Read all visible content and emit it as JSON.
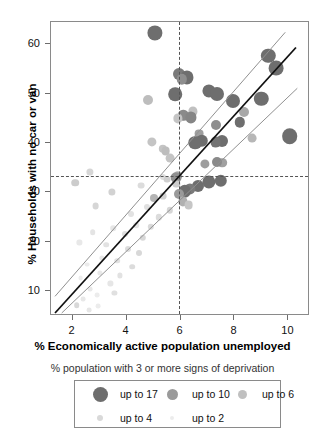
{
  "chart_data": {
    "type": "scatter",
    "title": "",
    "xlabel": "% Economically active population unemployed",
    "ylabel": "% Households with no car or van",
    "xlim": [
      1.2,
      10.8
    ],
    "ylim": [
      5.0,
      64.5
    ],
    "xticks": [
      2,
      4,
      6,
      8,
      10
    ],
    "yticks": [
      10,
      20,
      30,
      40,
      50,
      60
    ],
    "xticklabels": [
      "2",
      "4",
      "6",
      "8",
      "10"
    ],
    "yticklabels": [
      "10",
      "20",
      "30",
      "40",
      "50",
      "60"
    ],
    "grid": false,
    "legend_position": "below-axes",
    "legend_title": "% population with 3 or more signs of deprivation",
    "legend_entries": [
      {
        "label": "up to 17",
        "color": "#6e6e6e",
        "radius": 7.5
      },
      {
        "label": "up to 10",
        "color": "#9a9a9a",
        "radius": 5.5
      },
      {
        "label": "up to 6",
        "color": "#c0c0c0",
        "radius": 4.5
      },
      {
        "label": "up to 4",
        "color": "#d9d9d9",
        "radius": 3.2
      },
      {
        "label": "up to 2",
        "color": "#ececec",
        "radius": 2.4
      }
    ],
    "reference_lines": [
      {
        "orientation": "vertical",
        "value": 5.95,
        "style": "dotted",
        "color": "#555555"
      },
      {
        "orientation": "horizontal",
        "value": 33.4,
        "style": "dotted",
        "color": "#555555"
      }
    ],
    "fit_lines": [
      {
        "name": "regression",
        "color": "#111111",
        "width": 1.8,
        "x0": 1.35,
        "y0": 5.2,
        "x1": 10.35,
        "y1": 59.3
      },
      {
        "name": "upper-band",
        "color": "#8f8f8f",
        "width": 1.0,
        "x0": 1.35,
        "y0": 8.6,
        "x1": 9.95,
        "y1": 62.4
      },
      {
        "name": "lower-band",
        "color": "#8f8f8f",
        "width": 1.0,
        "x0": 1.6,
        "y0": 5.2,
        "x1": 10.4,
        "y1": 51.0
      }
    ],
    "points": [
      {
        "x": 5.05,
        "y": 62.3,
        "c": "#6e6e6e",
        "r": 7.6
      },
      {
        "x": 9.25,
        "y": 57.6,
        "c": "#6e6e6e",
        "r": 7.2
      },
      {
        "x": 9.55,
        "y": 55.2,
        "c": "#6e6e6e",
        "r": 7.4
      },
      {
        "x": 5.95,
        "y": 53.9,
        "c": "#7a7a7a",
        "r": 6.0
      },
      {
        "x": 6.25,
        "y": 53.3,
        "c": "#6e6e6e",
        "r": 6.6
      },
      {
        "x": 6.05,
        "y": 52.9,
        "c": "#8e8e8e",
        "r": 5.2
      },
      {
        "x": 5.8,
        "y": 49.9,
        "c": "#6e6e6e",
        "r": 6.8
      },
      {
        "x": 7.05,
        "y": 50.6,
        "c": "#6e6e6e",
        "r": 6.6
      },
      {
        "x": 7.35,
        "y": 49.9,
        "c": "#6e6e6e",
        "r": 7.0
      },
      {
        "x": 4.8,
        "y": 48.8,
        "c": "#bdbdbd",
        "r": 5.0
      },
      {
        "x": 7.95,
        "y": 48.5,
        "c": "#6e6e6e",
        "r": 7.0
      },
      {
        "x": 9.0,
        "y": 48.9,
        "c": "#6e6e6e",
        "r": 7.2
      },
      {
        "x": 8.35,
        "y": 46.3,
        "c": "#a8a8a8",
        "r": 5.0
      },
      {
        "x": 6.45,
        "y": 46.4,
        "c": "#c0c0c0",
        "r": 4.6
      },
      {
        "x": 6.1,
        "y": 45.6,
        "c": "#8a8a8a",
        "r": 5.2
      },
      {
        "x": 6.4,
        "y": 45.2,
        "c": "#858585",
        "r": 5.6
      },
      {
        "x": 5.9,
        "y": 45.0,
        "c": "#c4c4c4",
        "r": 4.6
      },
      {
        "x": 7.3,
        "y": 43.6,
        "c": "#8e8e8e",
        "r": 5.0
      },
      {
        "x": 6.7,
        "y": 41.9,
        "c": "#9f9f9f",
        "r": 4.4
      },
      {
        "x": 10.05,
        "y": 41.4,
        "c": "#6e6e6e",
        "r": 7.8
      },
      {
        "x": 8.65,
        "y": 41.0,
        "c": "#b7b7b7",
        "r": 4.4
      },
      {
        "x": 6.8,
        "y": 40.5,
        "c": "#6e6e6e",
        "r": 6.2
      },
      {
        "x": 7.55,
        "y": 40.4,
        "c": "#6e6e6e",
        "r": 6.0
      },
      {
        "x": 7.3,
        "y": 40.2,
        "c": "#747474",
        "r": 5.4
      },
      {
        "x": 6.55,
        "y": 40.1,
        "c": "#6e6e6e",
        "r": 6.8
      },
      {
        "x": 4.95,
        "y": 40.2,
        "c": "#c4c4c4",
        "r": 4.6
      },
      {
        "x": 5.35,
        "y": 38.8,
        "c": "#c4c4c4",
        "r": 4.2
      },
      {
        "x": 5.45,
        "y": 38.4,
        "c": "#bdbdbd",
        "r": 4.4
      },
      {
        "x": 7.55,
        "y": 36.0,
        "c": "#a0a0a0",
        "r": 4.8
      },
      {
        "x": 7.35,
        "y": 36.2,
        "c": "#8a8a8a",
        "r": 5.0
      },
      {
        "x": 5.6,
        "y": 37.0,
        "c": "#c4c4c4",
        "r": 4.4
      },
      {
        "x": 5.9,
        "y": 33.4,
        "c": "#b0b0b0",
        "r": 4.8
      },
      {
        "x": 5.85,
        "y": 33.0,
        "c": "#909090",
        "r": 5.4
      },
      {
        "x": 2.65,
        "y": 34.1,
        "c": "#d6d6d6",
        "r": 3.6
      },
      {
        "x": 2.1,
        "y": 32.0,
        "c": "#cccccc",
        "r": 3.8
      },
      {
        "x": 5.85,
        "y": 31.8,
        "c": "#cccccc",
        "r": 3.6
      },
      {
        "x": 7.05,
        "y": 32.2,
        "c": "#6e6e6e",
        "r": 6.6
      },
      {
        "x": 7.5,
        "y": 32.3,
        "c": "#6e6e6e",
        "r": 6.2
      },
      {
        "x": 6.65,
        "y": 31.3,
        "c": "#6e6e6e",
        "r": 6.0
      },
      {
        "x": 6.35,
        "y": 30.8,
        "c": "#7a7a7a",
        "r": 5.6
      },
      {
        "x": 6.15,
        "y": 30.2,
        "c": "#6e6e6e",
        "r": 6.2
      },
      {
        "x": 5.95,
        "y": 29.6,
        "c": "#9a9a9a",
        "r": 5.0
      },
      {
        "x": 6.1,
        "y": 28.2,
        "c": "#b0b0b0",
        "r": 4.6
      },
      {
        "x": 6.3,
        "y": 27.4,
        "c": "#c6c6c6",
        "r": 4.4
      },
      {
        "x": 3.45,
        "y": 30.1,
        "c": "#d2d2d2",
        "r": 3.6
      },
      {
        "x": 4.55,
        "y": 31.4,
        "c": "#dcdcdc",
        "r": 3.4
      },
      {
        "x": 2.85,
        "y": 27.2,
        "c": "#d6d6d6",
        "r": 3.4
      },
      {
        "x": 5.35,
        "y": 29.2,
        "c": "#d2d2d2",
        "r": 3.4
      },
      {
        "x": 5.0,
        "y": 28.8,
        "c": "#b4b4b4",
        "r": 4.0
      },
      {
        "x": 4.75,
        "y": 27.0,
        "c": "#e0e0e0",
        "r": 3.0
      },
      {
        "x": 5.6,
        "y": 26.4,
        "c": "#d6d6d6",
        "r": 3.2
      },
      {
        "x": 4.15,
        "y": 25.6,
        "c": "#e2e2e2",
        "r": 3.0
      },
      {
        "x": 5.2,
        "y": 25.0,
        "c": "#dcdcdc",
        "r": 3.2
      },
      {
        "x": 4.35,
        "y": 23.4,
        "c": "#e4e4e4",
        "r": 2.8
      },
      {
        "x": 4.9,
        "y": 23.0,
        "c": "#dadada",
        "r": 3.2
      },
      {
        "x": 3.5,
        "y": 22.8,
        "c": "#e6e6e6",
        "r": 2.8
      },
      {
        "x": 2.75,
        "y": 22.0,
        "c": "#e4e4e4",
        "r": 2.8
      },
      {
        "x": 3.95,
        "y": 21.6,
        "c": "#dedede",
        "r": 3.0
      },
      {
        "x": 4.6,
        "y": 20.8,
        "c": "#d8d8d8",
        "r": 3.2
      },
      {
        "x": 2.25,
        "y": 19.9,
        "c": "#e8e8e8",
        "r": 2.6
      },
      {
        "x": 3.25,
        "y": 19.4,
        "c": "#e2e2e2",
        "r": 2.8
      },
      {
        "x": 4.05,
        "y": 18.6,
        "c": "#dcdcdc",
        "r": 3.0
      },
      {
        "x": 4.45,
        "y": 17.8,
        "c": "#d8d8d8",
        "r": 3.0
      },
      {
        "x": 3.1,
        "y": 16.8,
        "c": "#e6e6e6",
        "r": 2.6
      },
      {
        "x": 3.65,
        "y": 16.2,
        "c": "#e2e2e2",
        "r": 2.8
      },
      {
        "x": 2.55,
        "y": 15.4,
        "c": "#ebebeb",
        "r": 2.4
      },
      {
        "x": 4.2,
        "y": 15.0,
        "c": "#dcdcdc",
        "r": 2.8
      },
      {
        "x": 3.0,
        "y": 13.8,
        "c": "#e8e8e8",
        "r": 2.6
      },
      {
        "x": 3.75,
        "y": 13.2,
        "c": "#e2e2e2",
        "r": 2.6
      },
      {
        "x": 2.3,
        "y": 12.6,
        "c": "#ececec",
        "r": 2.4
      },
      {
        "x": 3.4,
        "y": 11.6,
        "c": "#e6e6e6",
        "r": 2.6
      },
      {
        "x": 2.65,
        "y": 10.4,
        "c": "#e8e8e8",
        "r": 2.4
      },
      {
        "x": 3.55,
        "y": 9.6,
        "c": "#e0e0e0",
        "r": 2.6
      },
      {
        "x": 2.9,
        "y": 9.2,
        "c": "#ececec",
        "r": 2.4
      },
      {
        "x": 2.4,
        "y": 8.4,
        "c": "#e8e8e8",
        "r": 2.4
      },
      {
        "x": 2.15,
        "y": 7.2,
        "c": "#d8d8d8",
        "r": 2.8
      },
      {
        "x": 2.95,
        "y": 7.0,
        "c": "#ececec",
        "r": 2.4
      },
      {
        "x": 2.6,
        "y": 6.2,
        "c": "#e6e6e6",
        "r": 2.4
      },
      {
        "x": 5.35,
        "y": 33.2,
        "c": "#dedede",
        "r": 3.0
      },
      {
        "x": 5.5,
        "y": 32.6,
        "c": "#cfcfcf",
        "r": 3.4
      },
      {
        "x": 6.9,
        "y": 35.8,
        "c": "#9e9e9e",
        "r": 4.6
      },
      {
        "x": 8.2,
        "y": 44.2,
        "c": "#6e6e6e",
        "r": 5.2
      }
    ]
  }
}
